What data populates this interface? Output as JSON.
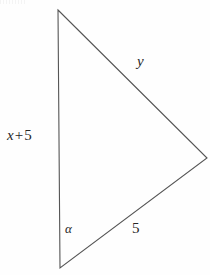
{
  "figure": {
    "type": "geometry-diagram",
    "shape": "triangle",
    "background_color": "#fefefe",
    "stroke_color": "#555555",
    "text_color": "#262626",
    "width": 210,
    "height": 275
  },
  "vertices": {
    "top": {
      "x": 58,
      "y": 10
    },
    "right": {
      "x": 207,
      "y": 158
    },
    "bottom": {
      "x": 60,
      "y": 268
    }
  },
  "labels": {
    "left_side": {
      "variable": "x",
      "operator": "+",
      "number": "5",
      "full_text": "x + 5"
    },
    "upper_right_side": "y",
    "lower_right_side": "5",
    "angle": "α"
  }
}
